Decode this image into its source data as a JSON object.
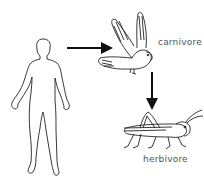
{
  "diagram": {
    "type": "food-chain",
    "nodes": [
      {
        "id": "human",
        "label": "",
        "icon": "human-outline"
      },
      {
        "id": "bird",
        "label": "carnivore",
        "icon": "bird-of-prey"
      },
      {
        "id": "grasshopper",
        "label": "herbivore",
        "icon": "grasshopper"
      }
    ],
    "edges": [
      {
        "from": "human",
        "to": "bird"
      },
      {
        "from": "bird",
        "to": "grasshopper"
      }
    ]
  },
  "labels": {
    "carnivore": "carnivore",
    "herbivore": "herbivore"
  },
  "colors": {
    "line": "#111111",
    "label": "#555555",
    "background": "#ffffff"
  }
}
